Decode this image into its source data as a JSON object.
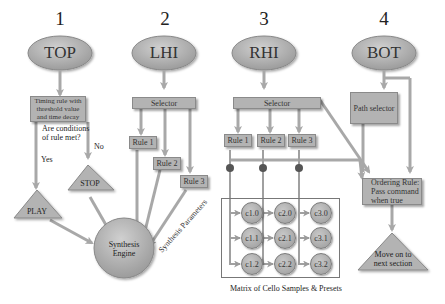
{
  "columns": [
    {
      "number": "1",
      "node": "TOP"
    },
    {
      "number": "2",
      "node": "LHI"
    },
    {
      "number": "3",
      "node": "RHI"
    },
    {
      "number": "4",
      "node": "BOT"
    }
  ],
  "top": {
    "rule_box": "Timing rule with threshold value and time decay",
    "question": "Are conditions of rule met?",
    "yes": "Yes",
    "no": "No",
    "play": "PLAY",
    "stop": "STOP"
  },
  "lhi": {
    "selector": "Selector",
    "rules": [
      "Rule 1",
      "Rule 2",
      "Rule 3"
    ]
  },
  "rhi": {
    "selector": "Selector",
    "rules": [
      "Rule 1",
      "Rule 2",
      "Rule 3"
    ]
  },
  "bot": {
    "path_selector": "Path selector",
    "ordering_rule": "Ordering Rule: Pass command when true",
    "next": "Move on to next section"
  },
  "engine": {
    "label": "Synthesis Engine",
    "params_label": "Synthesis Parameters"
  },
  "matrix": {
    "caption": "Matrix of Cello Samples & Presets",
    "cells": [
      [
        "c1.0",
        "c2.0",
        "c3.0"
      ],
      [
        "c1.1",
        "c2.1",
        "c3.1"
      ],
      [
        "c1.2",
        "c2.2",
        "c3.2"
      ]
    ]
  },
  "colors": {
    "node_fill": "#b3b3b3",
    "arrow": "#a0a0a0",
    "text": "#333333"
  }
}
